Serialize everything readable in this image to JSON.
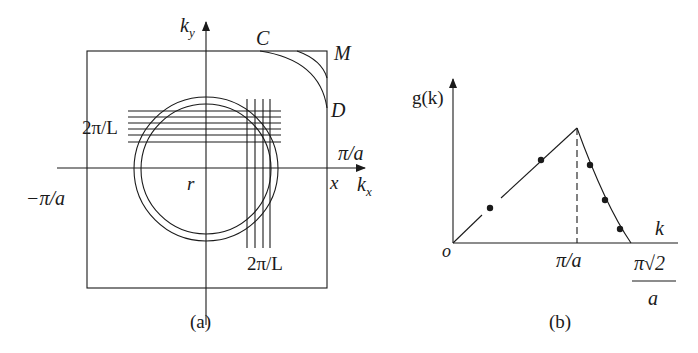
{
  "panel_a": {
    "caption": "(a)",
    "axis_ky": "k",
    "axis_ky_sub": "y",
    "axis_kx": "k",
    "axis_kx_sub": "x",
    "label_pi_a": "π/a",
    "label_neg_pi_a": "−π/a",
    "label_r": "r",
    "label_x": "x",
    "label_C": "C",
    "label_M": "M",
    "label_D": "D",
    "label_2pi_L_horizontal": "2π/L",
    "label_2pi_L_vertical": "2π/L"
  },
  "panel_b": {
    "caption": "(b)",
    "axis_y": "g(k)",
    "axis_x": "k",
    "origin": "o",
    "tick_pi_a": "π/a",
    "tick_pi_sqrt2_num": "π√2",
    "tick_pi_sqrt2_den": "a"
  },
  "colors": {
    "line": "#1a1a1a",
    "background": "#ffffff"
  }
}
